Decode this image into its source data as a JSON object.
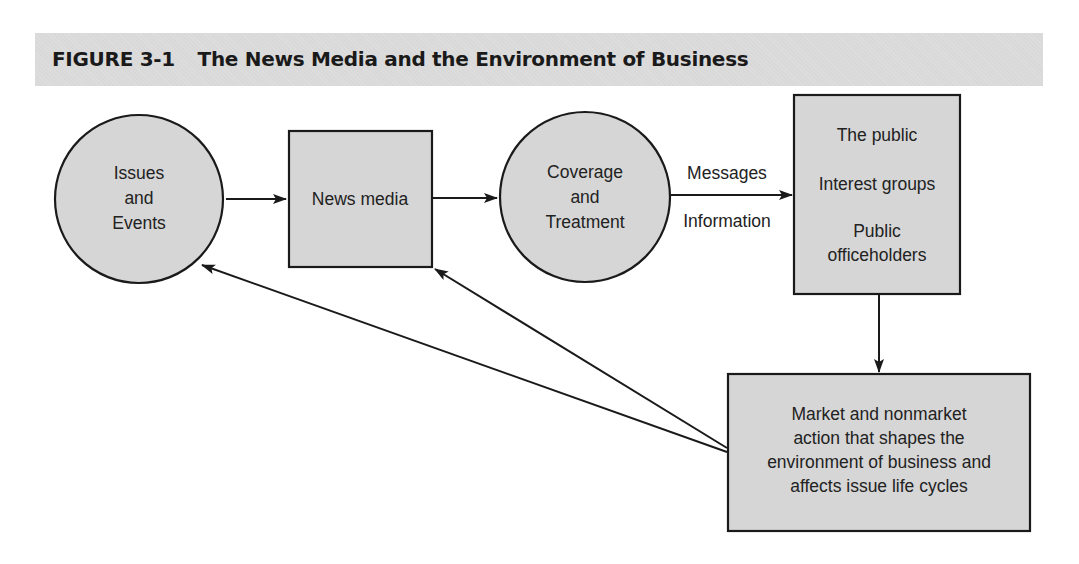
{
  "figure": {
    "label": "FIGURE 3-1",
    "title": "The News Media and the Environment of Business"
  },
  "nodes": {
    "issues_events": {
      "shape": "circle",
      "lines": [
        "Issues",
        "and",
        "Events"
      ]
    },
    "news_media": {
      "shape": "rectangle",
      "lines": [
        "News media"
      ]
    },
    "coverage_treatment": {
      "shape": "circle",
      "lines": [
        "Coverage",
        "and",
        "Treatment"
      ]
    },
    "audiences": {
      "shape": "rectangle",
      "lines": [
        "The public",
        "Interest groups",
        "Public",
        "officeholders"
      ]
    },
    "action": {
      "shape": "rectangle",
      "lines": [
        "Market and nonmarket",
        "action that shapes the",
        "environment of business and",
        "affects issue life cycles"
      ]
    }
  },
  "edge_labels": {
    "messages": "Messages",
    "information": "Information"
  },
  "edges": [
    {
      "from": "issues_events",
      "to": "news_media"
    },
    {
      "from": "news_media",
      "to": "coverage_treatment"
    },
    {
      "from": "coverage_treatment",
      "to": "audiences",
      "labels": [
        "Messages",
        "Information"
      ]
    },
    {
      "from": "audiences",
      "to": "action"
    },
    {
      "from": "action",
      "to": "issues_events"
    },
    {
      "from": "action",
      "to": "news_media"
    }
  ],
  "colors": {
    "fill": "#d6d6d6",
    "stroke": "#1a1a1a",
    "title_bar": "#d9d9d9"
  }
}
